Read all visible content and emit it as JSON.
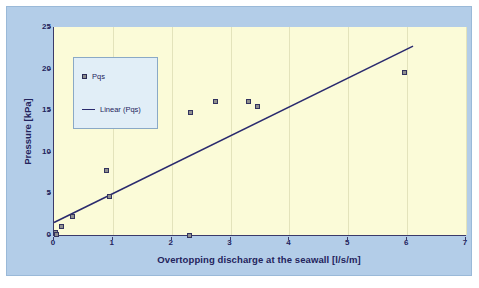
{
  "colors": {
    "outer_background": "#ffffff",
    "frame_background": "#b3cde8",
    "plot_background": "#fbfbd8",
    "axis": "#3a3a6a",
    "text": "#23235c",
    "legend_background": "#e1eef7",
    "legend_border": "#8aa9c6",
    "marker_fill": "#8f8f8f",
    "marker_edge": "#33335f",
    "trend_line": "#2a2a6e",
    "gridline": "#e3e3bb"
  },
  "chart_data": {
    "type": "scatter",
    "title": "",
    "xlabel": "Overtopping discharge at the seawall [l/s/m]",
    "ylabel": "Pressure [kPa]",
    "xlim": [
      0,
      7
    ],
    "ylim": [
      0,
      25
    ],
    "xticks": [
      0,
      1,
      2,
      3,
      4,
      5,
      6,
      7
    ],
    "yticks": [
      0,
      5,
      10,
      15,
      20,
      25
    ],
    "xtick_labels": [
      "0",
      "1",
      "2",
      "3",
      "4",
      "5",
      "6",
      "7"
    ],
    "ytick_labels": [
      "0",
      "5",
      "10",
      "15",
      "20",
      "25"
    ],
    "grid": "vertical-only-faint",
    "legend_position": "upper-left-inside",
    "legend_entries": [
      {
        "label": "Pqs",
        "marker": "square"
      },
      {
        "label": "Linear (Pqs)",
        "marker": "line"
      }
    ],
    "series": [
      {
        "name": "Pqs",
        "marker": "square",
        "points": [
          {
            "x": 0.02,
            "y": 0.3
          },
          {
            "x": 0.05,
            "y": 0.1
          },
          {
            "x": 0.12,
            "y": 1.0
          },
          {
            "x": 0.32,
            "y": 2.2
          },
          {
            "x": 0.9,
            "y": 7.8
          },
          {
            "x": 0.95,
            "y": 4.6
          },
          {
            "x": 2.3,
            "y": 0.0
          },
          {
            "x": 2.32,
            "y": 14.7
          },
          {
            "x": 2.75,
            "y": 16.1
          },
          {
            "x": 3.3,
            "y": 16.1
          },
          {
            "x": 3.45,
            "y": 15.5
          },
          {
            "x": 5.95,
            "y": 19.5
          }
        ]
      },
      {
        "name": "Linear (Pqs)",
        "type": "trendline",
        "from": {
          "x": 0.0,
          "y": 1.5
        },
        "to": {
          "x": 6.1,
          "y": 22.7
        }
      }
    ]
  }
}
